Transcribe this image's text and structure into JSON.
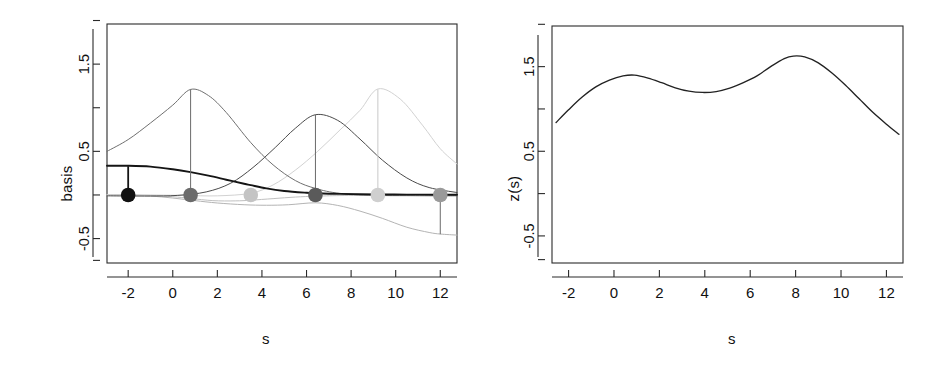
{
  "figure": {
    "background": "#ffffff",
    "panels": [
      "basis-panel",
      "z-panel"
    ]
  },
  "panel_left": {
    "ylabel": "basis",
    "xlabel": "s",
    "xticks": [
      "-2",
      "0",
      "2",
      "4",
      "6",
      "8",
      "10",
      "12"
    ],
    "yticks": [
      "1.5",
      "0.5",
      "-0.5"
    ]
  },
  "panel_right": {
    "ylabel": "z(s)",
    "xlabel": "s",
    "xticks": [
      "-2",
      "0",
      "2",
      "4",
      "6",
      "8",
      "10",
      "12"
    ],
    "yticks": [
      "1.5",
      "0.5",
      "-0.5"
    ]
  },
  "colors": {
    "axis": "#2a2a2a",
    "curve_black": "#151515",
    "curve_dark_gray": "#4a4a4a",
    "curve_mid_gray": "#6f6f6f",
    "curve_gray": "#8c8c8c",
    "curve_light_gray": "#b4b4b4",
    "curve_pale_gray": "#d2d2d2"
  },
  "chart_data": [
    {
      "type": "line",
      "id": "basis-panel",
      "title": "",
      "xlabel": "s",
      "ylabel": "basis",
      "xlim": [
        -2.95,
        12.75
      ],
      "ylim": [
        -0.78,
        1.96
      ],
      "xticks": [
        -2,
        0,
        2,
        4,
        6,
        8,
        10,
        12
      ],
      "xticklabels": [
        "-2",
        "0",
        "2",
        "4",
        "6",
        "8",
        "10",
        "12"
      ],
      "yticks": [
        1.5,
        0.5,
        -0.5
      ],
      "yticklabels": [
        "1.5",
        "0.5",
        "-0.5"
      ],
      "grid": false,
      "legend": "none",
      "knots": [
        -2.0,
        0.8,
        3.5,
        6.4,
        9.2,
        12.0
      ],
      "coefficients": [
        0.0,
        0.0,
        0.0,
        0.0,
        0.0,
        0.0
      ],
      "stick_tops": [
        0.33,
        1.21,
        0.02,
        0.92,
        1.21,
        -0.45
      ],
      "points": [
        {
          "s": -2.0,
          "y": 0.0,
          "color": "#111111",
          "label": "knot-point-1"
        },
        {
          "s": 0.8,
          "y": 0.0,
          "color": "#6b6b6b",
          "label": "knot-point-2"
        },
        {
          "s": 3.5,
          "y": 0.0,
          "color": "#c4c4c4",
          "label": "knot-point-3"
        },
        {
          "s": 6.4,
          "y": 0.0,
          "color": "#5a5a5a",
          "label": "knot-point-4"
        },
        {
          "s": 9.2,
          "y": 0.0,
          "color": "#cfcfcf",
          "label": "knot-point-5"
        },
        {
          "s": 12.0,
          "y": 0.0,
          "color": "#9a9a9a",
          "label": "knot-point-6"
        }
      ],
      "series": [
        {
          "name": "basis-1",
          "color": "#151515",
          "x": [
            -2.95,
            -2.0,
            -1.0,
            0.0,
            0.8,
            1.6,
            2.4,
            3.2,
            3.5,
            4.2,
            5.0,
            6.0,
            6.4,
            7.5,
            9.2,
            10.5,
            12.0,
            12.75
          ],
          "values": [
            0.335,
            0.335,
            0.325,
            0.295,
            0.262,
            0.222,
            0.175,
            0.128,
            0.112,
            0.075,
            0.046,
            0.025,
            0.02,
            0.012,
            0.006,
            0.004,
            0.003,
            0.003
          ]
        },
        {
          "name": "basis-2",
          "color": "#6f6f6f",
          "x": [
            -2.95,
            -2.0,
            -1.0,
            0.0,
            0.8,
            1.6,
            2.4,
            3.5,
            4.5,
            5.5,
            6.4,
            7.5,
            9.2,
            10.5,
            12.0,
            12.75
          ],
          "values": [
            0.5,
            0.635,
            0.825,
            1.03,
            1.21,
            1.14,
            0.945,
            0.6,
            0.345,
            0.165,
            0.075,
            0.018,
            -0.005,
            -0.008,
            -0.01,
            -0.01
          ]
        },
        {
          "name": "basis-3",
          "color": "#c0c0c0",
          "x": [
            -2.95,
            -2.0,
            -1.0,
            0.0,
            0.8,
            1.8,
            2.8,
            3.5,
            4.5,
            5.5,
            6.4,
            7.5,
            9.2,
            10.5,
            12.0,
            12.75
          ],
          "values": [
            0.0,
            0.0,
            -0.005,
            -0.02,
            -0.04,
            -0.065,
            -0.068,
            -0.06,
            -0.042,
            -0.024,
            -0.014,
            -0.007,
            -0.003,
            -0.002,
            -0.002,
            -0.002
          ]
        },
        {
          "name": "basis-4",
          "color": "#4a4a4a",
          "x": [
            -2.95,
            -2.0,
            -1.0,
            0.2,
            1.5,
            2.6,
            3.6,
            4.6,
            5.5,
            6.4,
            7.4,
            8.4,
            9.4,
            10.5,
            11.5,
            12.75
          ],
          "values": [
            -0.01,
            -0.012,
            -0.012,
            -0.005,
            0.035,
            0.135,
            0.315,
            0.545,
            0.765,
            0.92,
            0.855,
            0.64,
            0.4,
            0.195,
            0.085,
            0.028
          ]
        },
        {
          "name": "basis-5",
          "color": "#d2d2d2",
          "x": [
            -2.95,
            -2.0,
            -1.0,
            0.5,
            2.0,
            3.5,
            4.5,
            5.5,
            6.5,
            7.5,
            8.4,
            9.2,
            10.2,
            11.2,
            12.0,
            12.75
          ],
          "values": [
            0.0,
            0.0,
            0.0,
            -0.005,
            -0.01,
            0.02,
            0.115,
            0.285,
            0.5,
            0.745,
            0.97,
            1.215,
            1.1,
            0.8,
            0.53,
            0.355
          ]
        },
        {
          "name": "basis-6",
          "color": "#b4b4b4",
          "x": [
            -2.95,
            -2.0,
            -1.0,
            0.0,
            1.0,
            2.0,
            3.2,
            4.2,
            5.2,
            6.4,
            7.4,
            8.4,
            9.4,
            10.5,
            11.5,
            12.0,
            12.75
          ],
          "values": [
            0.0,
            0.0,
            -0.012,
            -0.035,
            -0.065,
            -0.092,
            -0.112,
            -0.118,
            -0.112,
            -0.09,
            -0.12,
            -0.185,
            -0.268,
            -0.37,
            -0.43,
            -0.448,
            -0.46
          ]
        }
      ]
    },
    {
      "type": "line",
      "id": "z-panel",
      "title": "",
      "xlabel": "s",
      "ylabel": "z(s)",
      "xlim": [
        -2.73,
        12.73
      ],
      "ylim": [
        -0.82,
        1.98
      ],
      "xticks": [
        -2,
        0,
        2,
        4,
        6,
        8,
        10,
        12
      ],
      "xticklabels": [
        "-2",
        "0",
        "2",
        "4",
        "6",
        "8",
        "10",
        "12"
      ],
      "yticks": [
        1.5,
        0.5,
        -0.5
      ],
      "yticklabels": [
        "1.5",
        "0.5",
        "-0.5"
      ],
      "grid": false,
      "legend": "none",
      "series": [
        {
          "name": "z(s)",
          "color": "#222222",
          "x": [
            -2.55,
            -2.0,
            -1.4,
            -0.8,
            -0.2,
            0.4,
            0.9,
            1.5,
            2.1,
            2.7,
            3.3,
            3.9,
            4.5,
            5.1,
            5.7,
            6.3,
            6.9,
            7.5,
            7.9,
            8.4,
            9.0,
            9.6,
            10.2,
            10.8,
            11.4,
            12.0,
            12.55
          ],
          "values": [
            0.84,
            0.99,
            1.14,
            1.26,
            1.34,
            1.39,
            1.4,
            1.365,
            1.31,
            1.25,
            1.21,
            1.195,
            1.205,
            1.245,
            1.31,
            1.39,
            1.5,
            1.595,
            1.625,
            1.615,
            1.545,
            1.425,
            1.28,
            1.12,
            0.96,
            0.82,
            0.7
          ]
        }
      ]
    }
  ]
}
